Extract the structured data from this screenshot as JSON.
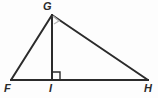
{
  "figure": {
    "kind": "geometry-diagram",
    "shape": "triangle-with-altitude",
    "background_color": "#fdfdfd",
    "stroke_color": "#2b2b2b",
    "marker_color": "#9a9a9a",
    "canvas": {
      "width": 158,
      "height": 98
    }
  },
  "labels": {
    "apex": "G",
    "left": "F",
    "foot": "I",
    "right": "H"
  },
  "points": {
    "G": {
      "x": 52,
      "y": 15
    },
    "F": {
      "x": 11,
      "y": 80
    },
    "I": {
      "x": 52,
      "y": 80
    },
    "H": {
      "x": 148,
      "y": 80
    }
  },
  "segments": [
    {
      "name": "FG",
      "from": "F",
      "to": "G",
      "stroke_width": 2
    },
    {
      "name": "GH",
      "from": "G",
      "to": "H",
      "stroke_width": 2
    },
    {
      "name": "FH",
      "from": "F",
      "to": "H",
      "stroke_width": 2
    },
    {
      "name": "GI",
      "from": "G",
      "to": "I",
      "stroke_width": 2
    }
  ],
  "angle_markers": [
    {
      "name": "right-angle-at-I",
      "vertex": "I",
      "type": "square",
      "size": 8,
      "color": "#2b2b2b"
    },
    {
      "name": "angle-at-G",
      "vertex": "G",
      "type": "square",
      "size": 7,
      "color": "#b5b5b5"
    }
  ]
}
